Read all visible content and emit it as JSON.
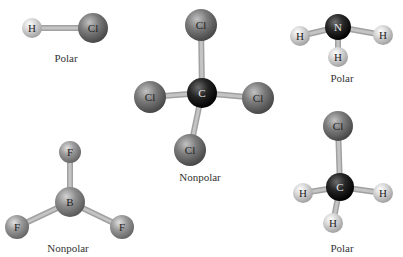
{
  "colors": {
    "background": "#ffffff",
    "Cl": "#7c7c7c",
    "C": "#252525",
    "N": "#2a2a2a",
    "H": "#d6d6d6",
    "F": "#9b9b9b",
    "B": "#8e8e8e",
    "bond": "#c4c4c4",
    "label_text": "#333333"
  },
  "molecules": [
    {
      "id": "HCl",
      "polarity_label": "Polar",
      "label_pos": [
        66,
        52
      ],
      "atoms": [
        {
          "symbol": "H",
          "x": 32,
          "y": 28,
          "r": 10
        },
        {
          "symbol": "Cl",
          "x": 93,
          "y": 28,
          "r": 15
        }
      ],
      "bonds": [
        [
          0,
          1
        ]
      ]
    },
    {
      "id": "CCl4",
      "polarity_label": "Nonpolar",
      "label_pos": [
        200,
        171
      ],
      "atoms": [
        {
          "symbol": "C",
          "x": 202,
          "y": 93,
          "r": 15
        },
        {
          "symbol": "Cl",
          "x": 201,
          "y": 25,
          "r": 16
        },
        {
          "symbol": "Cl",
          "x": 150,
          "y": 97,
          "r": 16
        },
        {
          "symbol": "Cl",
          "x": 258,
          "y": 98,
          "r": 16
        },
        {
          "symbol": "Cl",
          "x": 190,
          "y": 150,
          "r": 16
        }
      ],
      "bonds": [
        [
          0,
          1
        ],
        [
          0,
          2
        ],
        [
          0,
          3
        ],
        [
          0,
          4
        ]
      ]
    },
    {
      "id": "NH3",
      "polarity_label": "Polar",
      "label_pos": [
        342,
        72
      ],
      "atoms": [
        {
          "symbol": "N",
          "x": 338,
          "y": 27,
          "r": 13
        },
        {
          "symbol": "H",
          "x": 300,
          "y": 36,
          "r": 10
        },
        {
          "symbol": "H",
          "x": 383,
          "y": 35,
          "r": 10
        },
        {
          "symbol": "H",
          "x": 338,
          "y": 57,
          "r": 10
        }
      ],
      "bonds": [
        [
          0,
          1
        ],
        [
          0,
          2
        ],
        [
          0,
          3
        ]
      ]
    },
    {
      "id": "CH3Cl",
      "polarity_label": "Polar",
      "label_pos": [
        342,
        242
      ],
      "atoms": [
        {
          "symbol": "C",
          "x": 340,
          "y": 187,
          "r": 14
        },
        {
          "symbol": "Cl",
          "x": 338,
          "y": 126,
          "r": 15
        },
        {
          "symbol": "H",
          "x": 303,
          "y": 193,
          "r": 10
        },
        {
          "symbol": "H",
          "x": 383,
          "y": 193,
          "r": 10
        },
        {
          "symbol": "H",
          "x": 333,
          "y": 223,
          "r": 10
        }
      ],
      "bonds": [
        [
          0,
          1
        ],
        [
          0,
          2
        ],
        [
          0,
          3
        ],
        [
          0,
          4
        ]
      ]
    },
    {
      "id": "BF3",
      "polarity_label": "Nonpolar",
      "label_pos": [
        68,
        242
      ],
      "atoms": [
        {
          "symbol": "B",
          "x": 70,
          "y": 202,
          "r": 15
        },
        {
          "symbol": "F",
          "x": 70,
          "y": 152,
          "r": 11
        },
        {
          "symbol": "F",
          "x": 17,
          "y": 227,
          "r": 12
        },
        {
          "symbol": "F",
          "x": 122,
          "y": 227,
          "r": 12
        }
      ],
      "bonds": [
        [
          0,
          1
        ],
        [
          0,
          2
        ],
        [
          0,
          3
        ]
      ]
    }
  ]
}
